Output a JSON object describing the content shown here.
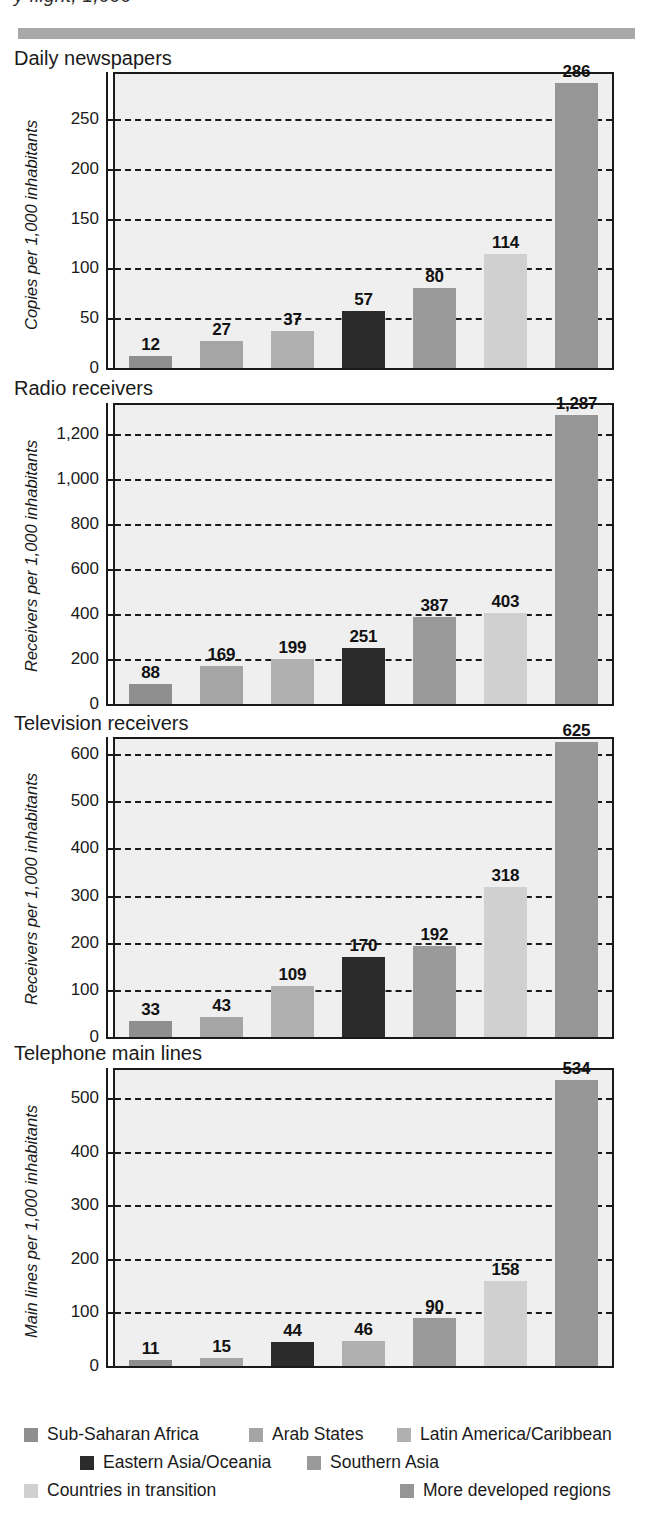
{
  "page": {
    "top_cut_text": "y flight, 1,000",
    "divider_color": "#a8a8a8"
  },
  "series_colors": {
    "Sub-Saharan Africa": "#8f8f8f",
    "Arab States": "#a5a5a5",
    "Latin America/Caribbean": "#b0b0b0",
    "Eastern Asia/Oceania": "#2b2b2b",
    "Southern Asia": "#9a9a9a",
    "Countries in transition": "#d0d0d0",
    "More developed regions": "#969696"
  },
  "legend": {
    "rows": [
      [
        {
          "label": "Sub-Saharan Africa",
          "color": "#8f8f8f",
          "left": 24
        },
        {
          "label": "Arab States",
          "color": "#a5a5a5",
          "left": 249
        },
        {
          "label": "Latin America/Caribbean",
          "color": "#b0b0b0",
          "left": 397
        }
      ],
      [
        {
          "label": "Eastern Asia/Oceania",
          "color": "#2b2b2b",
          "left": 80
        },
        {
          "label": "Southern Asia",
          "color": "#9a9a9a",
          "left": 307
        }
      ],
      [
        {
          "label": "Countries in transition",
          "color": "#d0d0d0",
          "left": 24
        },
        {
          "label": "More developed regions",
          "color": "#969696",
          "left": 400
        }
      ]
    ]
  },
  "chart_data": [
    {
      "type": "bar",
      "title": "Daily newspapers",
      "ylabel": "Copies per 1,000 inhabitants",
      "xlabel": "",
      "categories": [
        "Sub-Saharan Africa",
        "Arab States",
        "Latin America/Caribbean",
        "Eastern Asia/Oceania",
        "Southern Asia",
        "Countries in transition",
        "More developed regions"
      ],
      "values": [
        12,
        27,
        37,
        57,
        80,
        114,
        286
      ],
      "ticks": [
        0,
        50,
        100,
        150,
        200,
        250
      ],
      "tick_labels": [
        "0",
        "50",
        "100",
        "150",
        "200",
        "250"
      ],
      "ylim": [
        0,
        295
      ],
      "grid": true,
      "legend_position": "bottom"
    },
    {
      "type": "bar",
      "title": "Radio receivers",
      "ylabel": "Receivers per 1,000 inhabitants",
      "xlabel": "",
      "categories": [
        "Sub-Saharan Africa",
        "Arab States",
        "Latin America/Caribbean",
        "Eastern Asia/Oceania",
        "Southern Asia",
        "Countries in transition",
        "More developed regions"
      ],
      "values": [
        88,
        169,
        199,
        251,
        387,
        403,
        1287
      ],
      "ticks": [
        0,
        200,
        400,
        600,
        800,
        1000,
        1200
      ],
      "tick_labels": [
        "0",
        "200",
        "400",
        "600",
        "800",
        "1,000",
        "1,200"
      ],
      "ylim": [
        0,
        1330
      ],
      "grid": true,
      "legend_position": "bottom"
    },
    {
      "type": "bar",
      "title": "Television receivers",
      "ylabel": "Receivers per 1,000 inhabitants",
      "xlabel": "",
      "categories": [
        "Sub-Saharan Africa",
        "Arab States",
        "Latin America/Caribbean",
        "Eastern Asia/Oceania",
        "Southern Asia",
        "Countries in transition",
        "More developed regions"
      ],
      "values": [
        33,
        43,
        109,
        170,
        192,
        318,
        625
      ],
      "ticks": [
        0,
        100,
        200,
        300,
        400,
        500,
        600
      ],
      "tick_labels": [
        "0",
        "100",
        "200",
        "300",
        "400",
        "500",
        "600"
      ],
      "ylim": [
        0,
        632
      ],
      "grid": true,
      "legend_position": "bottom"
    },
    {
      "type": "bar",
      "title": "Telephone main lines",
      "ylabel": "Main lines per 1,000 inhabitants",
      "xlabel": "",
      "categories": [
        "Sub-Saharan Africa",
        "Arab States",
        "Eastern Asia/Oceania",
        "Latin America/Caribbean",
        "Southern Asia",
        "Countries in transition",
        "More developed regions"
      ],
      "values": [
        11,
        15,
        44,
        46,
        90,
        158,
        534
      ],
      "ticks": [
        0,
        100,
        200,
        300,
        400,
        500
      ],
      "tick_labels": [
        "0",
        "100",
        "200",
        "300",
        "400",
        "500"
      ],
      "ylim": [
        0,
        552
      ],
      "grid": true,
      "legend_position": "bottom"
    }
  ],
  "chart_layout": [
    {
      "title_top": 48,
      "plot_top": 72,
      "plot_height": 298,
      "ylabel_top": 330,
      "bar_series_order": [
        0,
        1,
        2,
        3,
        4,
        5,
        6
      ]
    },
    {
      "title_top": 378,
      "plot_top": 403,
      "plot_height": 303,
      "ylabel_top": 672,
      "bar_series_order": [
        0,
        1,
        3,
        2,
        4,
        5,
        6
      ]
    },
    {
      "title_top": 713,
      "plot_top": 737,
      "plot_height": 302,
      "ylabel_top": 1005,
      "bar_series_order": [
        0,
        1,
        2,
        3,
        4,
        5,
        6
      ]
    },
    {
      "title_top": 1043,
      "plot_top": 1068,
      "plot_height": 300,
      "ylabel_top": 1338,
      "bar_series_order": [
        0,
        1,
        3,
        2,
        4,
        5,
        6
      ]
    }
  ]
}
